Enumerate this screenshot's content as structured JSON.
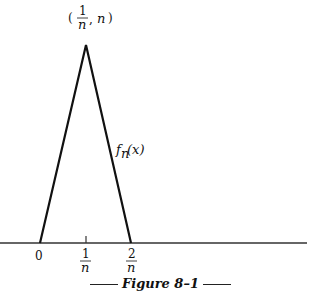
{
  "figure": {
    "caption": "Figure 8–1",
    "peak_label": {
      "x_num": "1",
      "x_den": "n",
      "y": "n"
    },
    "curve_label": "f",
    "curve_label_sub": "n",
    "curve_label_arg": "(x)",
    "ticks": [
      {
        "label": "0"
      },
      {
        "num": "1",
        "den": "n"
      },
      {
        "num": "2",
        "den": "n"
      }
    ]
  }
}
